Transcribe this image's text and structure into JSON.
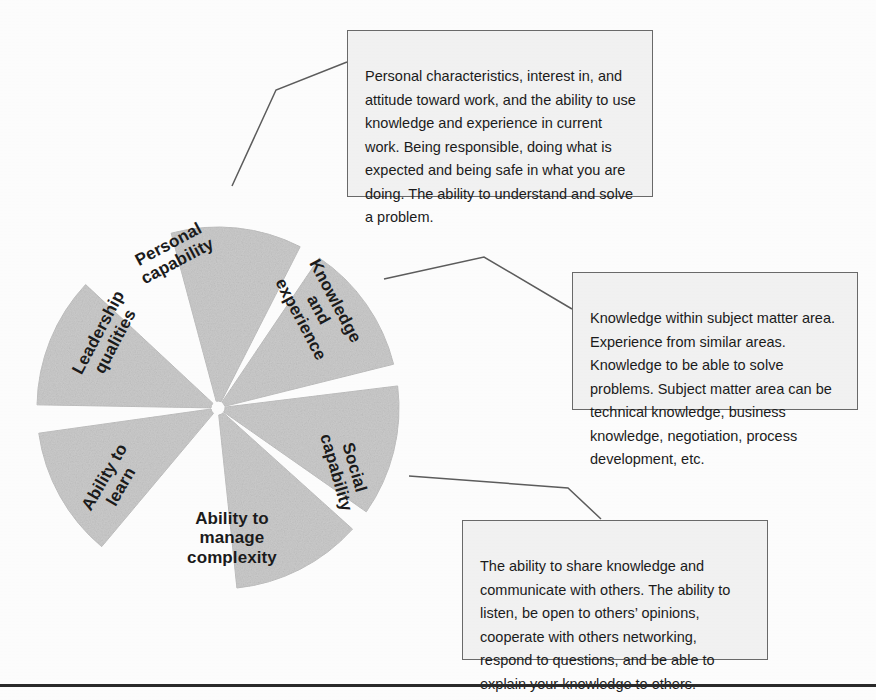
{
  "diagram": {
    "center": {
      "x": 218,
      "y": 408
    },
    "radius": 181,
    "segment_fill": "#cccccc",
    "segments": [
      {
        "id": "personal-capability",
        "label": "Personal\ncapability",
        "start_angle": -105,
        "end_angle": -63,
        "label_x": 173,
        "label_y": 253,
        "label_rotation": -28,
        "label_font_size": 17
      },
      {
        "id": "knowledge-and-experience",
        "label": "Knowledge\nand\nexperience",
        "start_angle": -56,
        "end_angle": -14,
        "label_x": 318,
        "label_y": 310,
        "label_rotation": 62,
        "label_font_size": 17
      },
      {
        "id": "social-capability",
        "label": "Social\ncapability",
        "start_angle": -7,
        "end_angle": 35,
        "label_x": 345,
        "label_y": 470,
        "label_rotation": 74,
        "label_font_size": 17
      },
      {
        "id": "ability-to-manage-complexity",
        "label": "Ability to\nmanage\ncomplexity",
        "start_angle": 42,
        "end_angle": 84,
        "label_x": 232,
        "label_y": 538,
        "label_rotation": 0,
        "label_font_size": 17
      },
      {
        "id": "ability-to-learn",
        "label": "Ability to\nlearn",
        "start_angle": 130,
        "end_angle": 172,
        "label_x": 113,
        "label_y": 482,
        "label_rotation": -60,
        "label_font_size": 17
      },
      {
        "id": "leadership-qualities",
        "label": "Leadership\nqualities",
        "start_angle": 181,
        "end_angle": 223,
        "label_x": 107,
        "label_y": 337,
        "label_rotation": -62,
        "label_font_size": 17
      }
    ]
  },
  "callouts": [
    {
      "id": "personal-capability-callout",
      "text": "Personal characteristics, interest in, and attitude toward work, and the ability to use knowledge and experience in current work. Being responsible, doing what is expected and being safe in what you are doing. The ability to understand and solve a problem.",
      "x": 347,
      "y": 30,
      "width": 306,
      "height": 167,
      "leader": "232,186 276,90 347,62"
    },
    {
      "id": "knowledge-and-experience-callout",
      "text": "Knowledge within subject matter area. Experience from similar areas. Knowledge to be able to solve problems. Subject matter area can be technical knowledge, business knowledge, negotiation, process development, etc.",
      "x": 572,
      "y": 272,
      "width": 286,
      "height": 138,
      "leader": "384,279 484,257 572,309"
    },
    {
      "id": "social-capability-callout",
      "text": "The ability to share knowledge and communicate with others. The ability to listen, be open to others’ opinions, cooperate with others networking, respond to questions, and be able to explain your knowledge to others.",
      "x": 462,
      "y": 520,
      "width": 306,
      "height": 140,
      "leader": "409,476 568,488 601,519"
    }
  ],
  "footer": {
    "rule_color": "#2b2b2b"
  }
}
